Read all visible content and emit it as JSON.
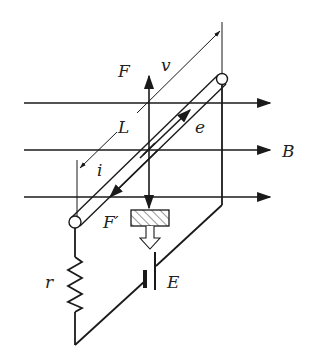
{
  "diagram": {
    "labels": {
      "force_up": "F",
      "velocity": "v",
      "length": "L",
      "emf": "e",
      "current": "i",
      "field": "B",
      "force_down": "F′",
      "resistor": "r",
      "battery": "E"
    },
    "colors": {
      "line": "#1a1a1a",
      "background": "#ffffff"
    }
  }
}
